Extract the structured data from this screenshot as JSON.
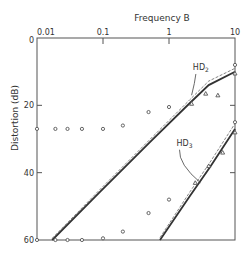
{
  "chart_data": {
    "type": "line",
    "title": "",
    "xlabel": "Frequency  B",
    "ylabel": "Distortion  (dB)",
    "xscale": "log",
    "xlim": [
      0.01,
      10
    ],
    "ylim": [
      0,
      60
    ],
    "y_inverted": true,
    "x_axis_position": "top",
    "grid": false,
    "x_ticks": [
      {
        "value": 0.01,
        "label": "0.01"
      },
      {
        "value": 0.1,
        "label": "0.1"
      },
      {
        "value": 1,
        "label": "1"
      },
      {
        "value": 10,
        "label": "10"
      }
    ],
    "y_ticks": [
      {
        "value": 0,
        "label": "0"
      },
      {
        "value": 20,
        "label": "20"
      },
      {
        "value": 40,
        "label": "40"
      },
      {
        "value": 60,
        "label": "60"
      }
    ],
    "series": [
      {
        "name": "HD2",
        "label_main": "HD",
        "label_sub": "2",
        "kind": "curve",
        "x": [
          0.017,
          0.09,
          0.51,
          2.07,
          4.0,
          10
        ],
        "y": [
          60,
          45.7,
          31,
          19.3,
          14,
          10
        ],
        "offset_x": [
          0.017,
          0.09,
          0.51,
          2.07,
          4.0,
          10
        ],
        "offset_y": [
          59.5,
          45.0,
          30.2,
          18.3,
          12.8,
          9.0
        ],
        "label_anchor": {
          "x": 2.3,
          "y": 9.5
        },
        "leader_to": {
          "x": 2.2,
          "y": 17
        }
      },
      {
        "name": "HD3",
        "label_main": "HD",
        "label_sub": "3",
        "kind": "curve",
        "x": [
          0.73,
          2.07,
          4.2,
          10
        ],
        "y": [
          60,
          46.9,
          38.3,
          27
        ],
        "offset_x": [
          0.73,
          2.07,
          4.2,
          10
        ],
        "offset_y": [
          59.3,
          45.7,
          36.9,
          25.4
        ],
        "label_anchor": {
          "x": 1.3,
          "y": 32
        },
        "leader_to": {
          "x": 3.0,
          "y": 43
        }
      }
    ],
    "points": {
      "circles": [
        {
          "x": 0.01,
          "y": 27
        },
        {
          "x": 0.019,
          "y": 27
        },
        {
          "x": 0.029,
          "y": 27
        },
        {
          "x": 0.048,
          "y": 27
        },
        {
          "x": 0.1,
          "y": 27
        },
        {
          "x": 0.2,
          "y": 26
        },
        {
          "x": 0.49,
          "y": 22
        },
        {
          "x": 1.0,
          "y": 20.5
        },
        {
          "x": 0.01,
          "y": 60
        },
        {
          "x": 0.019,
          "y": 60
        },
        {
          "x": 0.029,
          "y": 60
        },
        {
          "x": 0.048,
          "y": 60
        },
        {
          "x": 0.1,
          "y": 59.5
        },
        {
          "x": 0.2,
          "y": 57.5
        },
        {
          "x": 0.49,
          "y": 52
        },
        {
          "x": 1.0,
          "y": 48
        },
        {
          "x": 10,
          "y": 8
        },
        {
          "x": 10,
          "y": 25
        }
      ],
      "triangles": [
        {
          "x": 2.2,
          "y": 19.5
        },
        {
          "x": 3.6,
          "y": 16.5
        },
        {
          "x": 5.5,
          "y": 17
        },
        {
          "x": 10,
          "y": 10.5
        },
        {
          "x": 2.5,
          "y": 43
        },
        {
          "x": 4.0,
          "y": 38
        },
        {
          "x": 6.5,
          "y": 34
        },
        {
          "x": 10,
          "y": 28
        }
      ]
    }
  }
}
